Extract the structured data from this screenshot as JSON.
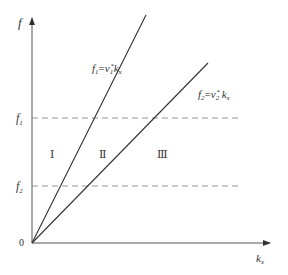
{
  "axes": {
    "y_label": "f",
    "x_label": "k",
    "x_label_sub": "x",
    "origin_label": "0"
  },
  "levels": [
    {
      "name": "f",
      "sub": "1"
    },
    {
      "name": "f",
      "sub": "2"
    }
  ],
  "lines": [
    {
      "lhs": "f",
      "lhs_sub": "1",
      "eq": "=",
      "v": "v",
      "v_sub": "1",
      "star": "*",
      "k": "k",
      "k_sub": "x"
    },
    {
      "lhs": "f",
      "lhs_sub": "2",
      "eq": "=",
      "v": "v",
      "v_sub": "2",
      "star": "*",
      "k": "k",
      "k_sub": "x"
    }
  ],
  "regions": [
    "Ⅰ",
    "Ⅱ",
    "Ⅲ"
  ],
  "colors": {
    "line": "#333333",
    "dash": "#888888",
    "axis": "#555555"
  }
}
